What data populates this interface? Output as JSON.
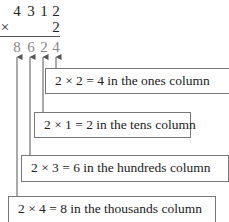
{
  "multiplication": {
    "multiplicand": [
      "4",
      "3",
      "1",
      "2"
    ],
    "operator": "×",
    "multiplier": "2",
    "product": [
      "8",
      "6",
      "2",
      "4"
    ]
  },
  "annotations": [
    {
      "text": "2 × 2 = 4 in the ones column",
      "points_to": "ones"
    },
    {
      "text": "2 × 1 = 2 in the tens column",
      "points_to": "tens"
    },
    {
      "text": "2 × 3 = 6 in the hundreds column",
      "points_to": "hundreds"
    },
    {
      "text": "2 × 4 = 8 in the thousands column",
      "points_to": "thousands"
    }
  ],
  "colors": {
    "text": "#222222",
    "product": "#888888",
    "lines": "#555555"
  }
}
